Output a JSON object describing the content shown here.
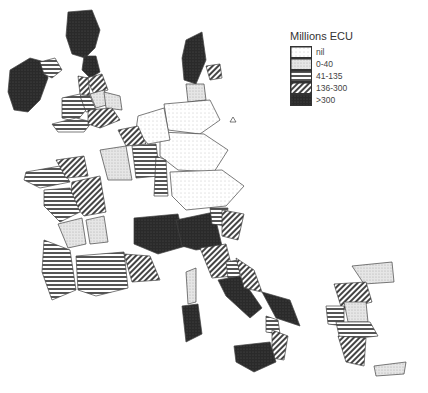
{
  "legend": {
    "title": "Millions ECU",
    "classes": [
      {
        "key": "nil",
        "label": "nil"
      },
      {
        "key": "c1",
        "label": "0-40"
      },
      {
        "key": "c2",
        "label": "41-135"
      },
      {
        "key": "c3",
        "label": "136-300"
      },
      {
        "key": "c4",
        "label": ">300"
      }
    ]
  },
  "regions": [
    {
      "name": "ireland",
      "class": "c4"
    },
    {
      "name": "northern-ireland",
      "class": "c2"
    },
    {
      "name": "scotland",
      "class": "c4"
    },
    {
      "name": "north-england",
      "class": "c4"
    },
    {
      "name": "yorkshire",
      "class": "c3"
    },
    {
      "name": "north-west-england",
      "class": "c3"
    },
    {
      "name": "east-midlands",
      "class": "c1"
    },
    {
      "name": "east-anglia",
      "class": "c1"
    },
    {
      "name": "wales",
      "class": "c2"
    },
    {
      "name": "west-midlands",
      "class": "c2"
    },
    {
      "name": "south-west-england",
      "class": "c2"
    },
    {
      "name": "south-east-england",
      "class": "c3"
    },
    {
      "name": "denmark",
      "class": "c4"
    },
    {
      "name": "danish-islands",
      "class": "c3"
    },
    {
      "name": "schleswig-holstein",
      "class": "c1"
    },
    {
      "name": "north-germany",
      "class": "nil"
    },
    {
      "name": "central-germany",
      "class": "nil"
    },
    {
      "name": "south-germany",
      "class": "nil"
    },
    {
      "name": "benelux",
      "class": "nil"
    },
    {
      "name": "nord-pas-de-calais",
      "class": "c3"
    },
    {
      "name": "bretagne",
      "class": "c2"
    },
    {
      "name": "basse-normandie",
      "class": "c3"
    },
    {
      "name": "centre",
      "class": "c3"
    },
    {
      "name": "ile-de-france",
      "class": "c1"
    },
    {
      "name": "lorraine",
      "class": "c2"
    },
    {
      "name": "alsace",
      "class": "c2"
    },
    {
      "name": "pays-de-la-loire",
      "class": "c2"
    },
    {
      "name": "poitou-charentes",
      "class": "c1"
    },
    {
      "name": "limousin",
      "class": "c1"
    },
    {
      "name": "aquitaine",
      "class": "c2"
    },
    {
      "name": "midi-pyrenees",
      "class": "c2"
    },
    {
      "name": "rhone-alpes",
      "class": "c4"
    },
    {
      "name": "provence",
      "class": "c3"
    },
    {
      "name": "corse",
      "class": "c1"
    },
    {
      "name": "north-italy",
      "class": "c4"
    },
    {
      "name": "trentino",
      "class": "c2"
    },
    {
      "name": "veneto",
      "class": "c3"
    },
    {
      "name": "tuscany",
      "class": "c3"
    },
    {
      "name": "umbria",
      "class": "c2"
    },
    {
      "name": "lazio-campania",
      "class": "c4"
    },
    {
      "name": "abruzzo",
      "class": "c3"
    },
    {
      "name": "puglia",
      "class": "c4"
    },
    {
      "name": "basilicata",
      "class": "c2"
    },
    {
      "name": "calabria",
      "class": "c3"
    },
    {
      "name": "sicily",
      "class": "c4"
    },
    {
      "name": "sardinia",
      "class": "c4"
    },
    {
      "name": "greece-thrace",
      "class": "c1"
    },
    {
      "name": "greece-macedonia",
      "class": "c3"
    },
    {
      "name": "greece-thessaly",
      "class": "c1"
    },
    {
      "name": "greece-epirus",
      "class": "c2"
    },
    {
      "name": "greece-central",
      "class": "c2"
    },
    {
      "name": "greece-peloponnese",
      "class": "c3"
    },
    {
      "name": "crete",
      "class": "c1"
    }
  ]
}
